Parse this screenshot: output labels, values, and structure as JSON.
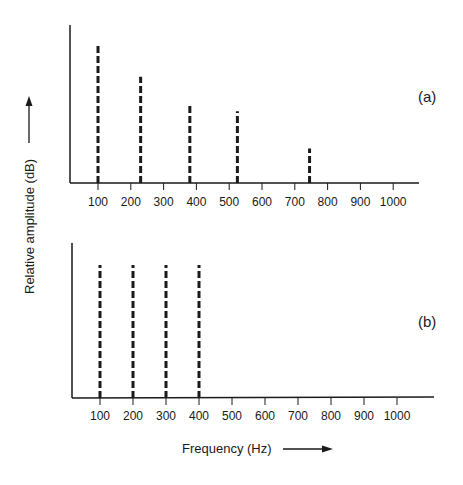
{
  "chart_data": [
    {
      "type": "bar",
      "panel_label": "(a)",
      "title": "",
      "xlabel": "Frequency (Hz)",
      "ylabel": "Relative amplitude (dB)",
      "x_ticks": [
        100,
        200,
        300,
        400,
        500,
        600,
        700,
        800,
        900,
        1000
      ],
      "grid": false,
      "style": "dashed vertical spectral lines",
      "x": [
        100,
        230,
        380,
        525,
        745
      ],
      "values": [
        100,
        77,
        56,
        52,
        25
      ],
      "value_units": "relative height (% of tallest line)"
    },
    {
      "type": "bar",
      "panel_label": "(b)",
      "title": "",
      "xlabel": "Frequency (Hz)",
      "ylabel": "Relative amplitude (dB)",
      "x_ticks": [
        100,
        200,
        300,
        400,
        500,
        600,
        700,
        800,
        900,
        1000
      ],
      "grid": false,
      "style": "dashed vertical spectral lines",
      "x": [
        100,
        200,
        300,
        400
      ],
      "values": [
        100,
        100,
        100,
        100
      ],
      "value_units": "relative height (% of tallest line)"
    }
  ],
  "labels": {
    "ylabel": "Relative amplitude (dB)",
    "xlabel": "Frequency (Hz)",
    "panel_a": "(a)",
    "panel_b": "(b)"
  },
  "ticks": [
    "100",
    "200",
    "300",
    "400",
    "500",
    "600",
    "700",
    "800",
    "900",
    "1000"
  ]
}
